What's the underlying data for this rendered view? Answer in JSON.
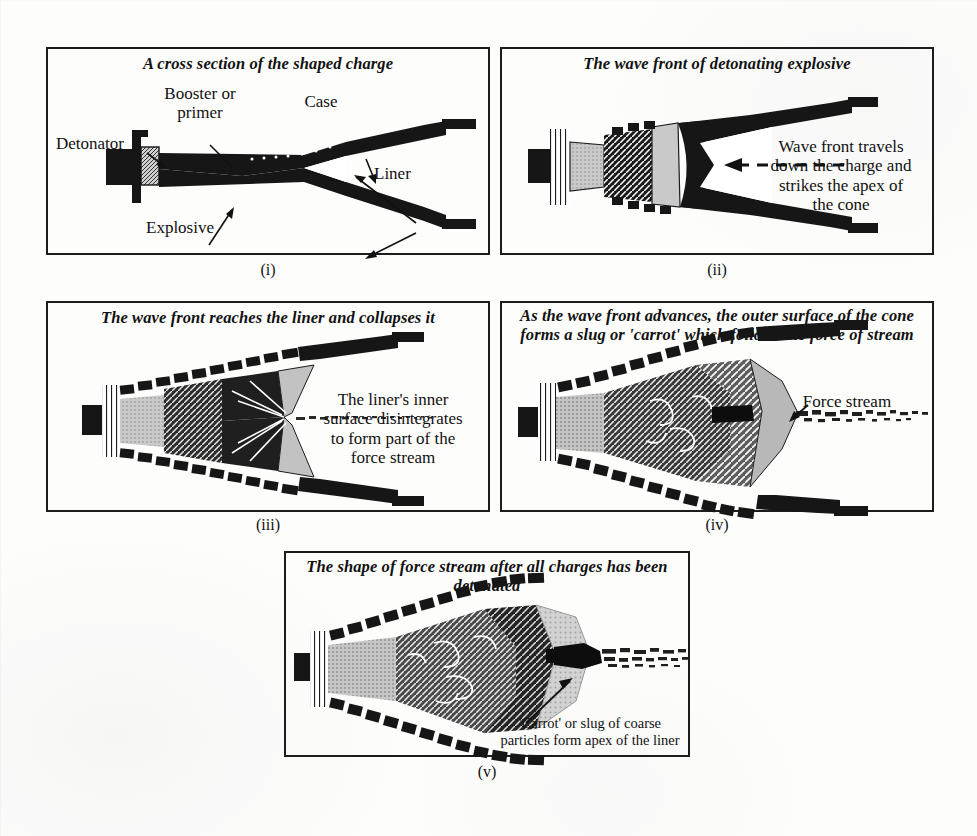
{
  "figure": {
    "panel_count": 5
  },
  "colors": {
    "ink": "#1c1c1c",
    "paper": "#fdfdfc",
    "metal_dark": "#161616",
    "explosive_light": "#c9c9c9",
    "wave_mid": "#6e6e6e",
    "wave_dark": "#3a3a3a",
    "slug_black": "#0d0d0d"
  },
  "panels": [
    {
      "id": "i",
      "roman": "(i)",
      "caption": "A cross section of the shaped charge",
      "labels": {
        "detonator": "Detonator",
        "booster": "Booster or\nprimer",
        "case": "Case",
        "liner": "Liner",
        "explosive": "Explosive"
      }
    },
    {
      "id": "ii",
      "roman": "(ii)",
      "caption": "The wave front of detonating explosive",
      "labels": {
        "note": "Wave front travels\ndown the charge and\nstrikes the apex of\nthe cone"
      }
    },
    {
      "id": "iii",
      "roman": "(iii)",
      "caption": "The wave front reaches the liner and\ncollapses it",
      "labels": {
        "note": "The liner's inner\nsurface disintegrates\nto form part of the\nforce stream"
      }
    },
    {
      "id": "iv",
      "roman": "(iv)",
      "caption": "As the wave front advances, the outer\nsurface of the cone forms a slug or\n'carrot' which follows the force of stream",
      "labels": {
        "force_stream": "Force stream"
      }
    },
    {
      "id": "v",
      "roman": "(v)",
      "caption": "The shape of force stream after all charges\nhas been detonated",
      "labels": {
        "carrot": "'Carrot' or slug of coarse\nparticles form apex of the liner"
      }
    }
  ]
}
